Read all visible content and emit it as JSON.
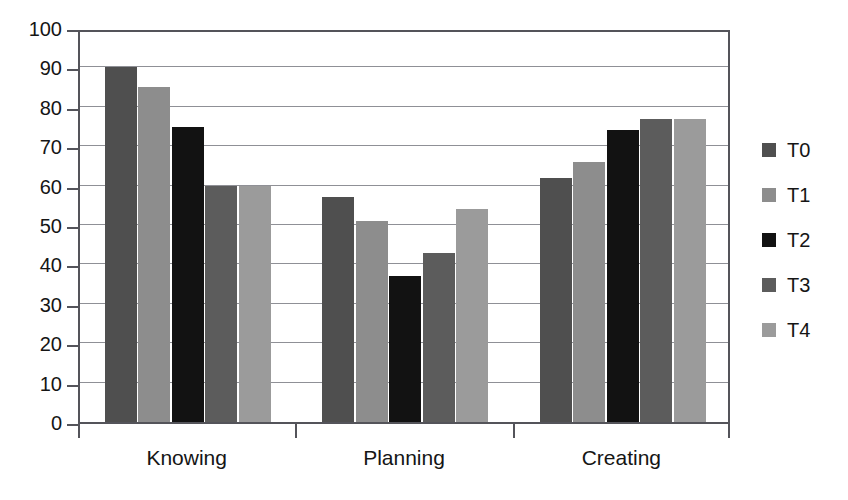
{
  "chart_data": {
    "type": "bar",
    "title": "",
    "subtitle": "",
    "xlabel": "",
    "ylabel": "",
    "categories": [
      "Knowing",
      "Planning",
      "Creating"
    ],
    "series": [
      {
        "name": "T0",
        "color": "#4f4f4f",
        "values": [
          90,
          57,
          62
        ]
      },
      {
        "name": "T1",
        "color": "#8d8d8d",
        "values": [
          85,
          51,
          66
        ]
      },
      {
        "name": "T2",
        "color": "#121212",
        "values": [
          75,
          37,
          74
        ]
      },
      {
        "name": "T3",
        "color": "#5c5c5c",
        "values": [
          60,
          43,
          77
        ]
      },
      {
        "name": "T4",
        "color": "#9b9b9b",
        "values": [
          60,
          54,
          77
        ]
      }
    ],
    "ylim": [
      0,
      100
    ],
    "ytick_step": 10,
    "yticks": [
      0,
      10,
      20,
      30,
      40,
      50,
      60,
      70,
      80,
      90,
      100
    ],
    "ytick_labels": [
      "0",
      "10",
      "20",
      "30",
      "40",
      "50",
      "60",
      "70",
      "80",
      "90",
      "100"
    ],
    "grid": true,
    "grid_axis": "y",
    "legend": {
      "position": "right",
      "entries": [
        "T0",
        "T1",
        "T2",
        "T3",
        "T4"
      ]
    },
    "axis_color": "#54545a",
    "grid_color": "#8f9096",
    "background_color": "#ffffff"
  }
}
